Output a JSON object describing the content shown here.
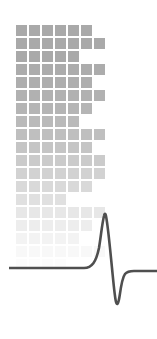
{
  "graphic": {
    "title": "ecg-grid-logo",
    "canvas": {
      "width": 157,
      "height": 339,
      "background": "#ffffff"
    },
    "grid": {
      "name": "fading-square-grid",
      "origin_x": 16,
      "origin_y": 25,
      "cell_size": 11,
      "gap": 2,
      "pitch": 13,
      "base_color": "#a9a9a9",
      "rows": 19,
      "row_column_counts": [
        6,
        7,
        5,
        7,
        6,
        7,
        6,
        5,
        7,
        6,
        7,
        7,
        6,
        4,
        7,
        6,
        5,
        7,
        4
      ],
      "row_opacities": [
        1.0,
        1.0,
        1.0,
        0.97,
        0.94,
        0.9,
        0.86,
        0.8,
        0.74,
        0.67,
        0.6,
        0.52,
        0.44,
        0.36,
        0.28,
        0.21,
        0.14,
        0.08,
        0.04
      ]
    },
    "waveform": {
      "name": "ecg-pulse-trace",
      "stroke_color": "#4f4f4f",
      "stroke_width": 2.6,
      "baseline_y": 268,
      "start_x": 9,
      "end_x": 157,
      "peak": {
        "x": 105,
        "y": 213
      },
      "trough": {
        "x": 116,
        "y": 303
      },
      "path": "M 9 268 L 84 268 C 92 268 96 262 99 248 C 101 236 102 224 104 216 C 104.6 213 105.4 213 106 216 C 108 226 110 248 112 268 C 113.4 282 114.6 296 116 302 C 117 306 118.4 304 119.6 296 C 121 286 122.6 277 125 274 C 127 271.6 130 271 134 271 L 157 271"
    }
  }
}
